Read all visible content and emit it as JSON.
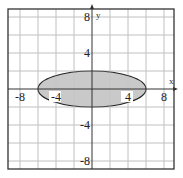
{
  "chart_data": {
    "type": "area",
    "title": "",
    "xlabel": "x",
    "ylabel": "y",
    "xlim": [
      -9.3,
      9.1
    ],
    "ylim": [
      -8.9,
      8.9
    ],
    "grid": true,
    "grid_step": 2,
    "x_ticks": [
      {
        "value": -8,
        "label": "-8"
      },
      {
        "value": -4,
        "label": "-4"
      },
      {
        "value": 4,
        "label": "4"
      },
      {
        "value": 8,
        "label": "8"
      }
    ],
    "y_ticks": [
      {
        "value": 8,
        "label": "8"
      },
      {
        "value": 4,
        "label": "4"
      },
      {
        "value": -4,
        "label": "-4"
      },
      {
        "value": -8,
        "label": "-8"
      }
    ],
    "shaded_region": {
      "shape": "ellipse",
      "center": [
        0,
        0
      ],
      "semi_axis_x": 6,
      "semi_axis_y": 2,
      "inequality": "x^2/36 + y^2/4 <= 1",
      "boundary": "solid"
    },
    "colors": {
      "fill": "#c9c9c9",
      "grid": "#c4c4c4",
      "axis": "#333333",
      "frame": "#333333",
      "boundary": "#222222"
    }
  }
}
